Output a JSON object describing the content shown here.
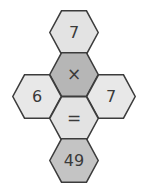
{
  "puzzle": {
    "type": "hexagon-equation-puzzle",
    "layout": "cross",
    "equation": "7 × ? = 49",
    "colors": {
      "background": "#ffffff",
      "stroke": "#3c3c3c",
      "fill_light": "#e3e3e3",
      "fill_medium": "#b6b6b6",
      "text": "#3a3a3a"
    },
    "cells": [
      {
        "id": "top",
        "label": "7",
        "role": "operand",
        "fill": "#e3e3e3",
        "position": "top"
      },
      {
        "id": "operator",
        "label": "×",
        "role": "operator",
        "fill": "#b6b6b6",
        "position": "middle-upper"
      },
      {
        "id": "left",
        "label": "6",
        "role": "choice",
        "fill": "#e8e8e8",
        "position": "left"
      },
      {
        "id": "right",
        "label": "7",
        "role": "choice",
        "fill": "#e8e8e8",
        "position": "right"
      },
      {
        "id": "equals",
        "label": "=",
        "role": "operator",
        "fill": "#e3e3e3",
        "position": "middle-lower"
      },
      {
        "id": "bottom",
        "label": "49",
        "role": "result",
        "fill": "#c4c4c4",
        "position": "bottom"
      }
    ]
  }
}
